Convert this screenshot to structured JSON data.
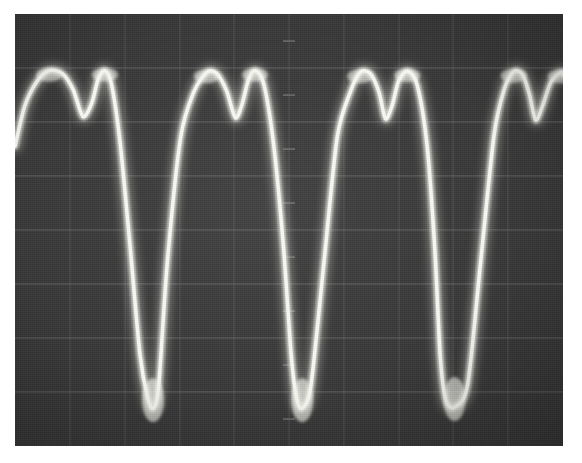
{
  "figure": {
    "kind": "oscilloscope-photograph",
    "title": "Oscilloscope screen photograph of a repetitive sawtooth-like waveform",
    "screen": {
      "background_color": "#3b3b3b",
      "trace_color": "#f2f2ee",
      "graticule_color": "#6e6e6e",
      "border_color": "#ffffff",
      "left": 15,
      "top": 14,
      "width": 548,
      "height": 432
    },
    "graticule": {
      "visible": true,
      "horizontal_divisions": 8,
      "vertical_divisions": 10,
      "style": "faint ruled lines with centre tick marks",
      "horizontal_line_y": [
        54,
        108,
        162,
        216,
        270,
        324,
        378
      ],
      "vertical_line_x": [
        55,
        110,
        165,
        219,
        274,
        329,
        384,
        438,
        493
      ]
    }
  },
  "chart_data": {
    "type": "line",
    "xlabel": "Time (divisions)",
    "ylabel": "Amplitude (divisions)",
    "xlim": [
      0,
      10
    ],
    "ylim": [
      -4,
      4
    ],
    "grid": true,
    "legend": null,
    "annotations": [
      "4 full cycles visible across the 10 horizontal divisions",
      "Each crest shows a double-hump / notch before the steep fall",
      "Troughs are sharp V shapes that overshoot at the bottom",
      "Trace shows blooming / over-exposure on slow-moving crest and trough regions"
    ],
    "series": [
      {
        "name": "trace",
        "period_divisions": 2.5,
        "cycles": 4,
        "peak_value": 3.0,
        "trough_value": -3.3,
        "x": [
          0.0,
          0.18,
          0.4,
          0.62,
          0.86,
          1.06,
          1.24,
          1.4,
          1.52,
          1.64,
          1.76,
          1.92,
          2.1,
          2.28,
          2.42,
          2.52,
          2.62,
          2.78,
          3.02,
          3.26,
          3.5,
          3.68,
          3.86,
          4.02,
          4.14,
          4.26,
          4.38,
          4.54,
          4.72,
          4.9,
          5.04,
          5.14,
          5.24,
          5.4,
          5.64,
          5.88,
          6.12,
          6.3,
          6.48,
          6.64,
          6.76,
          6.88,
          7.0,
          7.16,
          7.34,
          7.52,
          7.66,
          7.76,
          7.86,
          8.02,
          8.26,
          8.5,
          8.74,
          8.92,
          9.1,
          9.26,
          9.38,
          9.5,
          9.62,
          9.78,
          9.96,
          10.0
        ],
        "y": [
          1.55,
          2.3,
          2.75,
          2.95,
          2.9,
          2.6,
          2.1,
          2.35,
          2.8,
          2.95,
          2.7,
          1.6,
          -0.3,
          -2.3,
          -3.1,
          -3.3,
          -2.9,
          -0.6,
          1.7,
          2.55,
          2.92,
          2.9,
          2.58,
          2.08,
          2.32,
          2.78,
          2.95,
          2.7,
          1.58,
          -0.32,
          -2.32,
          -3.12,
          -3.3,
          -2.88,
          -0.58,
          1.72,
          2.56,
          2.92,
          2.9,
          2.56,
          2.06,
          2.3,
          2.76,
          2.94,
          2.68,
          1.56,
          -0.34,
          -2.34,
          -3.14,
          -3.28,
          -2.86,
          -0.56,
          1.74,
          2.58,
          2.93,
          2.88,
          2.54,
          2.04,
          2.28,
          2.74,
          2.92,
          2.88
        ]
      }
    ],
    "yticks": [
      -4,
      -3,
      -2,
      -1,
      0,
      1,
      2,
      3,
      4
    ],
    "xticks": [
      0,
      1,
      2,
      3,
      4,
      5,
      6,
      7,
      8,
      9,
      10
    ],
    "ytick_labels": [
      "",
      "",
      "",
      "",
      "",
      "",
      "",
      "",
      ""
    ],
    "xtick_labels": [
      "",
      "",
      "",
      "",
      "",
      "",
      "",
      "",
      "",
      "",
      ""
    ]
  }
}
